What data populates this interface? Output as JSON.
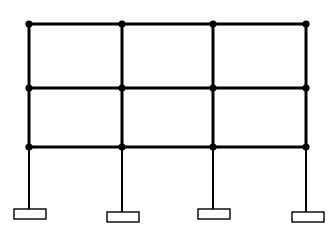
{
  "figure": {
    "background_color": "#ffffff",
    "line_color": "#000000",
    "node_color": "#000000",
    "plate_fill_color": "#ffffff",
    "plate_stroke_color": "#000000"
  },
  "canvas": {
    "width": 335,
    "height": 226
  },
  "geometry": {
    "column_x": [
      29,
      122,
      213,
      306
    ],
    "beam_levels_y": [
      24,
      88,
      147
    ],
    "column_count": 4,
    "bay_count": 3,
    "storey_count": 3,
    "beam_stroke_width": 3,
    "column_upper_stroke_width": 3,
    "column_lower_stroke_width": 2,
    "node_radius": 3.6
  },
  "beams": [
    {
      "name": "roof-beam",
      "level_index": 0,
      "y": 24,
      "x_start": 29,
      "x_end": 306
    },
    {
      "name": "second-floor-beam",
      "level_index": 1,
      "y": 88,
      "x_start": 29,
      "x_end": 306
    },
    {
      "name": "first-floor-beam",
      "level_index": 2,
      "y": 147,
      "x_start": 29,
      "x_end": 306
    }
  ],
  "columns": [
    {
      "name": "column-1",
      "x": 29,
      "y_top": 24,
      "y_bottom": 209
    },
    {
      "name": "column-2",
      "x": 122,
      "y_top": 24,
      "y_bottom": 212
    },
    {
      "name": "column-3",
      "x": 213,
      "y_top": 24,
      "y_bottom": 209
    },
    {
      "name": "column-4",
      "x": 306,
      "y_top": 24,
      "y_bottom": 212
    }
  ],
  "nodes": [
    {
      "id": "N1",
      "x": 29,
      "y": 24
    },
    {
      "id": "N2",
      "x": 122,
      "y": 24
    },
    {
      "id": "N3",
      "x": 213,
      "y": 24
    },
    {
      "id": "N4",
      "x": 306,
      "y": 24
    },
    {
      "id": "N5",
      "x": 29,
      "y": 88
    },
    {
      "id": "N6",
      "x": 122,
      "y": 88
    },
    {
      "id": "N7",
      "x": 213,
      "y": 88
    },
    {
      "id": "N8",
      "x": 306,
      "y": 88
    },
    {
      "id": "N9",
      "x": 29,
      "y": 147
    },
    {
      "id": "N10",
      "x": 122,
      "y": 147
    },
    {
      "id": "N11",
      "x": 213,
      "y": 147
    },
    {
      "id": "N12",
      "x": 306,
      "y": 147
    }
  ],
  "base_plates": [
    {
      "name": "base-plate-1",
      "x": 14,
      "y": 209,
      "width": 32,
      "height": 10
    },
    {
      "name": "base-plate-2",
      "x": 107,
      "y": 212,
      "width": 32,
      "height": 10
    },
    {
      "name": "base-plate-3",
      "x": 198,
      "y": 209,
      "width": 32,
      "height": 10
    },
    {
      "name": "base-plate-4",
      "x": 292,
      "y": 212,
      "width": 32,
      "height": 10
    }
  ]
}
